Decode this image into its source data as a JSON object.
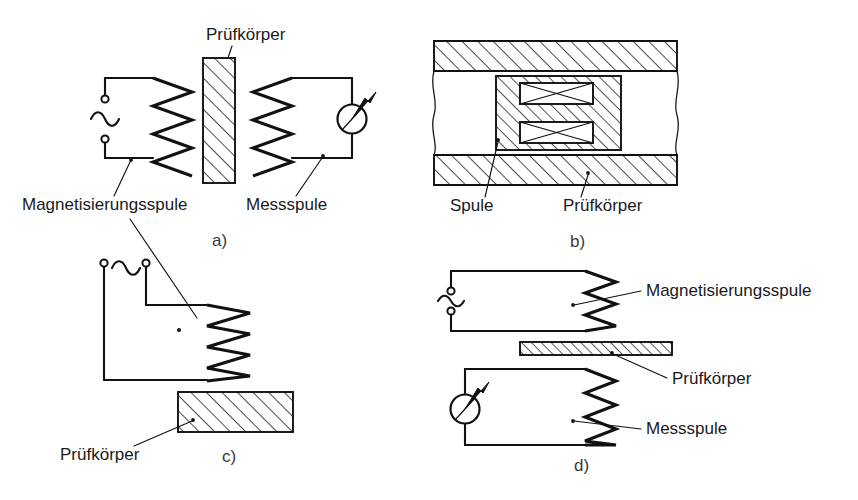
{
  "figure": {
    "background_color": "#ffffff",
    "line_color": "#111111",
    "text_color": "#1a1a1a"
  },
  "panels": [
    {
      "id": "a",
      "letter": "a)",
      "labels": {
        "specimen": "Prüfkörper",
        "magnetizing_coil": "Magnetisierungsspule",
        "measuring_coil": "Messspule"
      },
      "components": {
        "ac_source": "ac-source-symbol",
        "meter": "indicating-meter"
      }
    },
    {
      "id": "b",
      "letter": "b)",
      "labels": {
        "coil": "Spule",
        "specimen": "Prüfkörper"
      },
      "components": {
        "yoke": "u-core-yoke",
        "windings": "crossed-winding-symbol"
      }
    },
    {
      "id": "c",
      "letter": "c)",
      "labels": {
        "specimen": "Prüfkörper"
      },
      "components": {
        "ac_source": "ac-source-symbol",
        "coil": "probe-coil"
      }
    },
    {
      "id": "d",
      "letter": "d)",
      "labels": {
        "magnetizing_coil": "Magnetisierungsspule",
        "specimen": "Prüfkörper",
        "measuring_coil": "Messspule"
      },
      "components": {
        "ac_source": "ac-source-symbol",
        "meter": "indicating-meter"
      }
    }
  ]
}
